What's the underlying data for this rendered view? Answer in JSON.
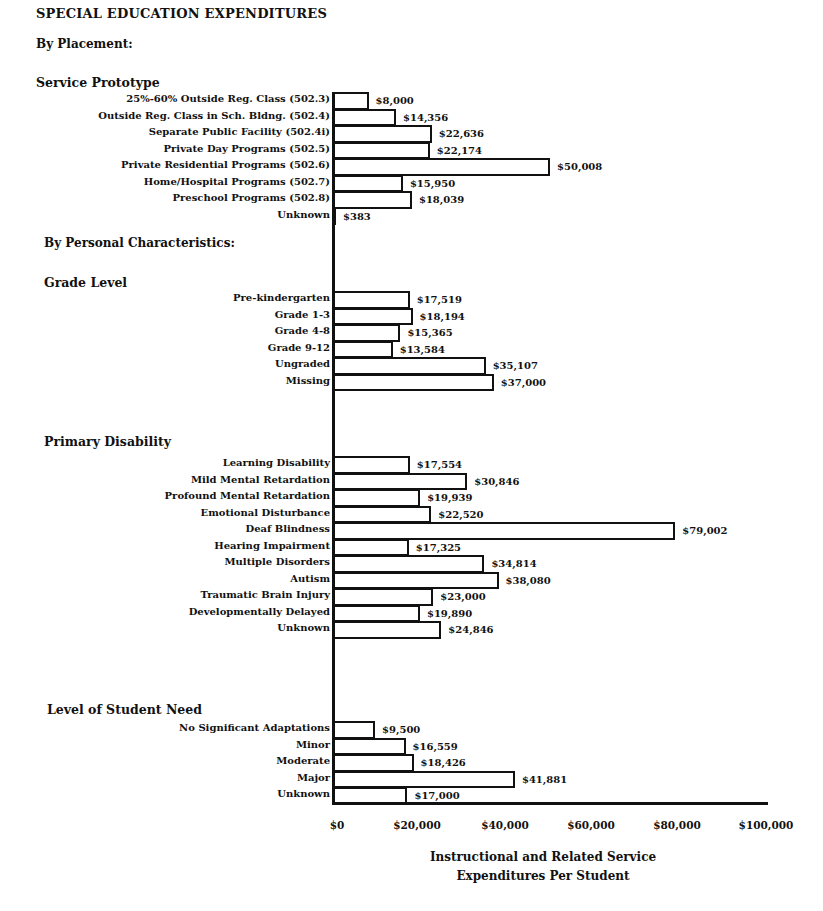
{
  "page": {
    "title": "SPECIAL EDUCATION EXPENDITURES",
    "by_placement": "By Placement:",
    "by_personal": "By Personal Characteristics:"
  },
  "chart_data": {
    "type": "bar",
    "orientation": "horizontal",
    "title": "SPECIAL EDUCATION EXPENDITURES",
    "xlabel": "Instructional and Related Service Expenditures Per Student",
    "xlabel_lines": [
      "Instructional and Related Service",
      "Expenditures Per Student"
    ],
    "ylabel": "",
    "xlim": [
      0,
      100000
    ],
    "x_ticks": [
      "$0",
      "$20,000",
      "$40,000",
      "$60,000",
      "$80,000",
      "$100,000"
    ],
    "grid": false,
    "legend": null,
    "groups": [
      {
        "section": "By Placement:",
        "name": "Service Prototype",
        "categories": [
          "25%-60% Outside Reg. Class (502.3)",
          "Outside Reg. Class in Sch. Bldng. (502.4)",
          "Separate Public Facility (502.4i)",
          "Private Day Programs (502.5)",
          "Private Residential Programs (502.6)",
          "Home/Hospital Programs (502.7)",
          "Preschool Programs (502.8)",
          "Unknown"
        ],
        "values": [
          8000,
          14356,
          22636,
          22174,
          50008,
          15950,
          18039,
          383
        ],
        "value_labels": [
          "$8,000",
          "$14,356",
          "$22,636",
          "$22,174",
          "$50,008",
          "$15,950",
          "$18,039",
          "$383"
        ]
      },
      {
        "section": "By Personal Characteristics:",
        "name": "Grade Level",
        "categories": [
          "Pre-kindergarten",
          "Grade 1-3",
          "Grade 4-8",
          "Grade 9-12",
          "Ungraded",
          "Missing"
        ],
        "values": [
          17519,
          18194,
          15365,
          13584,
          35107,
          37000
        ],
        "value_labels": [
          "$17,519",
          "$18,194",
          "$15,365",
          "$13,584",
          "$35,107",
          "$37,000"
        ]
      },
      {
        "section": "By Personal Characteristics:",
        "name": "Primary Disability",
        "categories": [
          "Learning Disability",
          "Mild Mental Retardation",
          "Profound Mental Retardation",
          "Emotional Disturbance",
          "Deaf Blindness",
          "Hearing Impairment",
          "Multiple Disorders",
          "Autism",
          "Traumatic Brain Injury",
          "Developmentally Delayed",
          "Unknown"
        ],
        "values": [
          17554,
          30846,
          19939,
          22520,
          79002,
          17325,
          34814,
          38080,
          23000,
          19890,
          24846
        ],
        "value_labels": [
          "$17,554",
          "$30,846",
          "$19,939",
          "$22,520",
          "$79,002",
          "$17,325",
          "$34,814",
          "$38,080",
          "$23,000",
          "$19,890",
          "$24,846"
        ]
      },
      {
        "section": "By Personal Characteristics:",
        "name": "Level of Student Need",
        "categories": [
          "No Significant Adaptations",
          "Minor",
          "Moderate",
          "Major",
          "Unknown"
        ],
        "values": [
          9500,
          16559,
          18426,
          41881,
          17000
        ],
        "value_labels": [
          "$9,500",
          "$16,559",
          "$18,426",
          "$41,881",
          "$17,000"
        ]
      }
    ]
  },
  "colors": {
    "ink": "#111111",
    "bar_fill": "#ffffff",
    "background": "#ffffff"
  }
}
